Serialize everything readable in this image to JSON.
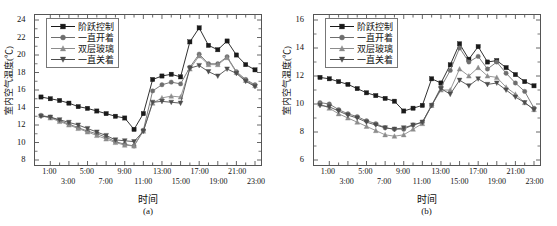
{
  "figure": {
    "axis_title_x": "时间",
    "axis_title_y": "室内空气温度(℃)",
    "legend": [
      {
        "label": "阶跃控制",
        "marker": "square",
        "color": "#1a1a1a"
      },
      {
        "label": "一直开着",
        "marker": "circle",
        "color": "#6e6e6e"
      },
      {
        "label": "双层玻璃",
        "marker": "triangle-up",
        "color": "#8c8c8c"
      },
      {
        "label": "一直关着",
        "marker": "triangle-down",
        "color": "#4d4d4d"
      }
    ],
    "panels": [
      {
        "caption": "(a)"
      },
      {
        "caption": "(b)"
      }
    ]
  },
  "chart_data": [
    {
      "type": "line",
      "title": "",
      "caption": "(a)",
      "xlabel": "时间",
      "ylabel": "室内空气温度(℃)",
      "ylim": [
        8,
        24
      ],
      "yticks": [
        8,
        10,
        12,
        14,
        16,
        18,
        20,
        22,
        24
      ],
      "xlim": [
        0,
        23
      ],
      "xticks": [
        1,
        2,
        3,
        4,
        5,
        6,
        7,
        8,
        9,
        10,
        11,
        12,
        13,
        14,
        15,
        16,
        17,
        18,
        19,
        20,
        21,
        22,
        23
      ],
      "xticklabels": [
        "1:00",
        "3:00",
        "5:00",
        "7:00",
        "9:00",
        "11:00",
        "13:00",
        "15:00",
        "17:00",
        "19:00",
        "21:00",
        "23:00"
      ],
      "grid": false,
      "legend_position": "upper-left",
      "x": [
        0,
        1,
        2,
        3,
        4,
        5,
        6,
        7,
        8,
        9,
        10,
        11,
        12,
        13,
        14,
        15,
        16,
        17,
        18,
        19,
        20,
        21,
        22,
        23
      ],
      "series": [
        {
          "name": "阶跃控制",
          "color": "#1a1a1a",
          "marker": "square",
          "values": [
            15.2,
            15.0,
            14.8,
            14.5,
            14.1,
            13.9,
            13.6,
            13.3,
            13.0,
            12.8,
            11.5,
            13.3,
            17.2,
            17.6,
            17.8,
            17.5,
            21.5,
            23.1,
            21.1,
            20.6,
            21.6,
            20.0,
            18.9,
            18.3
          ]
        },
        {
          "name": "一直开着",
          "color": "#6e6e6e",
          "marker": "circle",
          "values": [
            13.1,
            12.9,
            12.5,
            12.1,
            11.7,
            11.3,
            11.0,
            10.6,
            10.1,
            9.8,
            9.6,
            11.4,
            15.9,
            16.6,
            16.9,
            16.7,
            18.6,
            20.1,
            19.0,
            19.0,
            19.8,
            18.1,
            17.2,
            16.6
          ]
        },
        {
          "name": "双层玻璃",
          "color": "#8c8c8c",
          "marker": "triangle-up",
          "values": [
            13.1,
            12.8,
            12.4,
            12.0,
            11.6,
            11.2,
            10.8,
            10.4,
            10.0,
            9.7,
            9.6,
            11.3,
            14.5,
            15.1,
            15.3,
            15.2,
            18.4,
            19.9,
            18.9,
            18.9,
            19.7,
            18.0,
            17.1,
            16.5
          ]
        },
        {
          "name": "一直关着",
          "color": "#4d4d4d",
          "marker": "triangle-down",
          "values": [
            13.0,
            12.9,
            12.6,
            12.3,
            12.0,
            11.6,
            11.2,
            10.8,
            10.3,
            10.2,
            10.1,
            11.3,
            14.6,
            14.7,
            14.6,
            14.5,
            18.5,
            18.8,
            18.1,
            17.6,
            18.4,
            17.9,
            17.0,
            16.4
          ]
        }
      ]
    },
    {
      "type": "line",
      "title": "",
      "caption": "(b)",
      "xlabel": "时间",
      "ylabel": "室内空气温度(℃)",
      "ylim": [
        6,
        16
      ],
      "yticks": [
        6,
        8,
        10,
        12,
        14,
        16
      ],
      "xlim": [
        0,
        23
      ],
      "xticks": [
        1,
        2,
        3,
        4,
        5,
        6,
        7,
        8,
        9,
        10,
        11,
        12,
        13,
        14,
        15,
        16,
        17,
        18,
        19,
        20,
        21,
        22,
        23
      ],
      "xticklabels": [
        "1:00",
        "3:00",
        "5:00",
        "7:00",
        "9:00",
        "11:00",
        "13:00",
        "15:00",
        "17:00",
        "19:00",
        "21:00",
        "23:00"
      ],
      "grid": false,
      "legend_position": "upper-left",
      "x": [
        0,
        1,
        2,
        3,
        4,
        5,
        6,
        7,
        8,
        9,
        10,
        11,
        12,
        13,
        14,
        15,
        16,
        17,
        18,
        19,
        20,
        21,
        22,
        23
      ],
      "series": [
        {
          "name": "阶跃控制",
          "color": "#1a1a1a",
          "marker": "square",
          "values": [
            11.9,
            11.8,
            11.6,
            11.4,
            11.1,
            10.8,
            10.6,
            10.4,
            10.2,
            9.5,
            9.7,
            9.9,
            11.8,
            11.5,
            12.8,
            14.3,
            13.2,
            14.1,
            13.0,
            13.1,
            12.6,
            12.1,
            11.6,
            11.3
          ]
        },
        {
          "name": "一直开着",
          "color": "#6e6e6e",
          "marker": "circle",
          "values": [
            10.1,
            10.0,
            9.6,
            9.3,
            9.1,
            8.8,
            8.6,
            8.3,
            8.2,
            8.2,
            8.5,
            8.7,
            9.9,
            11.2,
            12.4,
            14.0,
            13.0,
            13.4,
            12.5,
            13.0,
            12.2,
            11.5,
            10.9,
            9.7
          ]
        },
        {
          "name": "双层玻璃",
          "color": "#8c8c8c",
          "marker": "triangle-up",
          "values": [
            10.0,
            9.7,
            9.3,
            9.0,
            8.7,
            8.4,
            8.1,
            7.8,
            7.7,
            7.8,
            8.2,
            8.6,
            9.9,
            11.0,
            11.0,
            12.5,
            12.0,
            12.6,
            12.0,
            11.9,
            11.2,
            10.7,
            10.1,
            9.6
          ]
        },
        {
          "name": "一直关着",
          "color": "#4d4d4d",
          "marker": "triangle-down",
          "values": [
            9.9,
            9.8,
            9.5,
            9.2,
            9.0,
            8.7,
            8.5,
            8.3,
            8.2,
            8.3,
            8.5,
            8.7,
            9.9,
            11.1,
            10.7,
            11.7,
            11.3,
            11.8,
            11.4,
            11.5,
            11.0,
            10.5,
            10.1,
            9.6
          ]
        }
      ]
    }
  ]
}
